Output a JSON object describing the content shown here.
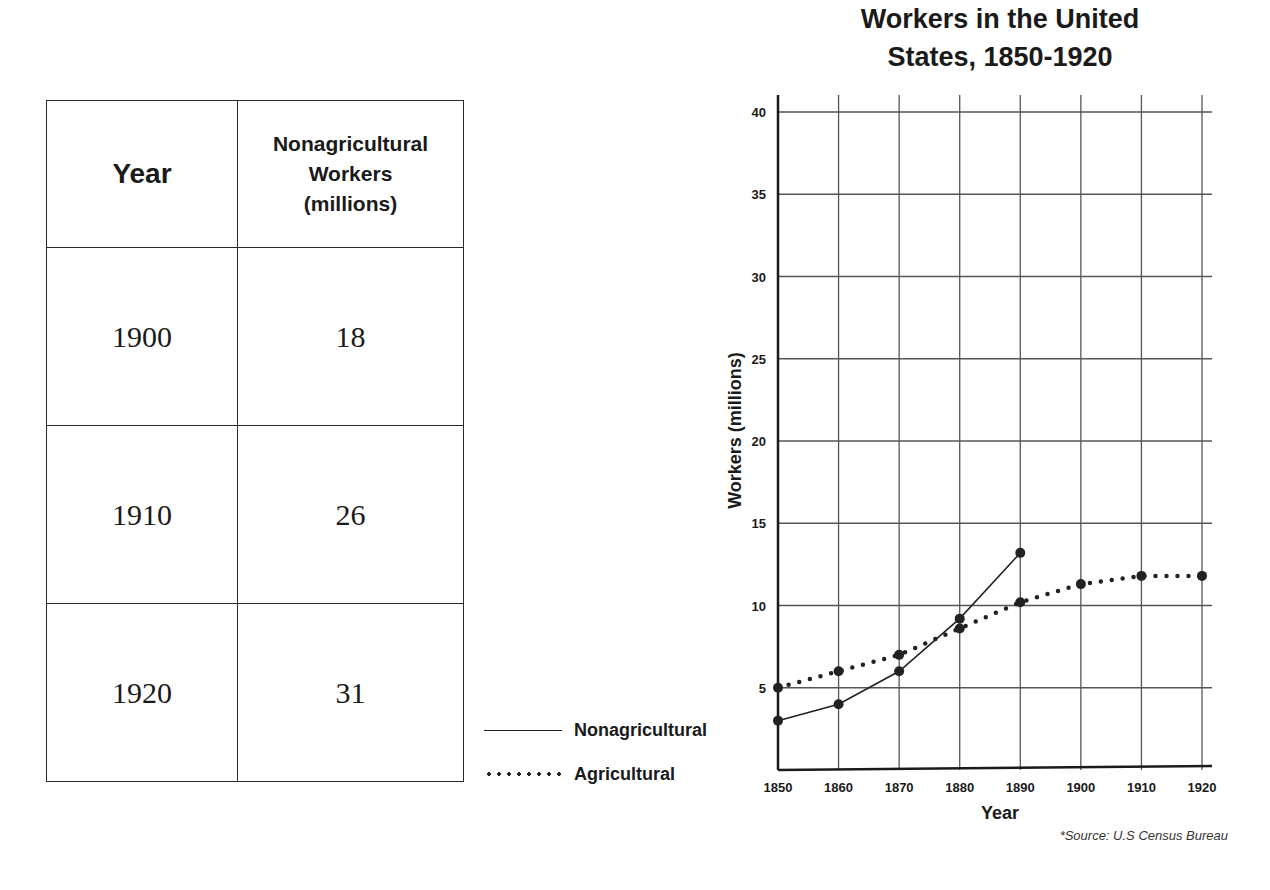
{
  "table": {
    "headers": [
      "Year",
      "Nonagricultural Workers (millions)"
    ],
    "header_lines": {
      "col2": [
        "Nonagricultural",
        "Workers",
        "(millions)"
      ]
    },
    "rows": [
      {
        "year": "1900",
        "value": "18"
      },
      {
        "year": "1910",
        "value": "26"
      },
      {
        "year": "1920",
        "value": "31"
      }
    ]
  },
  "legend": {
    "items": [
      {
        "label": "Nonagricultural",
        "style": "solid"
      },
      {
        "label": "Agricultural",
        "style": "dotted"
      }
    ]
  },
  "source_note": "*Source: U.S Census Bureau",
  "chart_data": {
    "type": "line",
    "title": "Workers in the United States, 1850-1920",
    "title_lines": [
      "Workers in the United",
      "States, 1850-1920"
    ],
    "xlabel": "Year",
    "ylabel": "Workers (millions)",
    "x": [
      1850,
      1860,
      1870,
      1880,
      1890,
      1900,
      1910,
      1920
    ],
    "x_ticks": [
      "1850",
      "1860",
      "1870",
      "1880",
      "1890",
      "1900",
      "1910",
      "1920"
    ],
    "y_ticks": [
      "5",
      "10",
      "15",
      "20",
      "25",
      "30",
      "35",
      "40"
    ],
    "ylim": [
      0,
      40
    ],
    "grid": true,
    "legend_position": "left-bottom outside",
    "series": [
      {
        "name": "Nonagricultural",
        "line_style": "solid",
        "x": [
          1850,
          1860,
          1870,
          1880,
          1890
        ],
        "values": [
          3.0,
          4.0,
          6.0,
          9.2,
          13.2
        ]
      },
      {
        "name": "Agricultural",
        "line_style": "dotted",
        "x": [
          1850,
          1860,
          1870,
          1880,
          1890,
          1900,
          1910,
          1920
        ],
        "values": [
          5.0,
          6.0,
          7.0,
          8.6,
          10.2,
          11.3,
          11.8,
          11.8
        ]
      }
    ],
    "colors": {
      "line": "#222222",
      "grid": "#555555",
      "axis": "#1a1a1a"
    }
  }
}
